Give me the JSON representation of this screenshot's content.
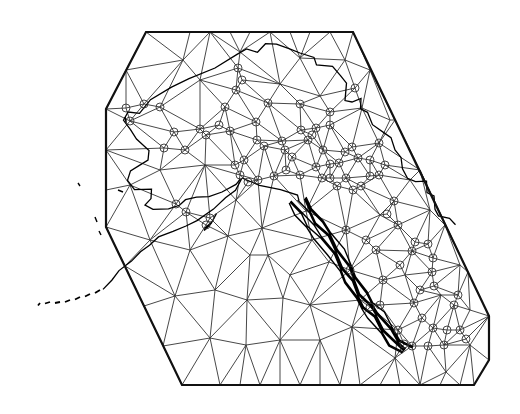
{
  "map": {
    "title": "Triangulated mesh over Alaska",
    "width": 520,
    "height": 414,
    "colors": {
      "background": "#ffffff",
      "hull": "#111111",
      "mesh": "#333333",
      "coast": "#000000",
      "station": "#333333"
    },
    "hull": [
      [
        146,
        32
      ],
      [
        353,
        32
      ],
      [
        489,
        316
      ],
      [
        489,
        360
      ],
      [
        474,
        385
      ],
      [
        182,
        385
      ],
      [
        106,
        227
      ],
      [
        106,
        109
      ]
    ],
    "stations": [
      [
        238,
        68
      ],
      [
        242,
        80
      ],
      [
        236,
        90
      ],
      [
        225,
        107
      ],
      [
        268,
        103
      ],
      [
        300,
        104
      ],
      [
        355,
        88
      ],
      [
        330,
        125
      ],
      [
        301,
        130
      ],
      [
        219,
        125
      ],
      [
        200,
        129
      ],
      [
        174,
        132
      ],
      [
        160,
        107
      ],
      [
        144,
        104
      ],
      [
        126,
        108
      ],
      [
        130,
        121
      ],
      [
        164,
        148
      ],
      [
        185,
        150
      ],
      [
        206,
        135
      ],
      [
        230,
        131
      ],
      [
        256,
        122
      ],
      [
        257,
        140
      ],
      [
        264,
        146
      ],
      [
        282,
        141
      ],
      [
        285,
        150
      ],
      [
        292,
        157
      ],
      [
        308,
        140
      ],
      [
        312,
        135
      ],
      [
        316,
        128
      ],
      [
        323,
        150
      ],
      [
        330,
        164
      ],
      [
        339,
        163
      ],
      [
        345,
        152
      ],
      [
        352,
        147
      ],
      [
        358,
        158
      ],
      [
        370,
        160
      ],
      [
        379,
        143
      ],
      [
        330,
        112
      ],
      [
        244,
        160
      ],
      [
        235,
        165
      ],
      [
        240,
        175
      ],
      [
        248,
        182
      ],
      [
        258,
        180
      ],
      [
        274,
        176
      ],
      [
        286,
        170
      ],
      [
        300,
        175
      ],
      [
        316,
        167
      ],
      [
        322,
        178
      ],
      [
        330,
        178
      ],
      [
        337,
        186
      ],
      [
        346,
        178
      ],
      [
        353,
        190
      ],
      [
        361,
        186
      ],
      [
        370,
        176
      ],
      [
        379,
        175
      ],
      [
        385,
        165
      ],
      [
        176,
        204
      ],
      [
        186,
        212
      ],
      [
        210,
        218
      ],
      [
        206,
        225
      ],
      [
        394,
        201
      ],
      [
        387,
        214
      ],
      [
        398,
        225
      ],
      [
        415,
        242
      ],
      [
        412,
        251
      ],
      [
        428,
        244
      ],
      [
        433,
        258
      ],
      [
        432,
        272
      ],
      [
        434,
        286
      ],
      [
        420,
        290
      ],
      [
        414,
        303
      ],
      [
        422,
        318
      ],
      [
        433,
        328
      ],
      [
        447,
        330
      ],
      [
        460,
        330
      ],
      [
        466,
        339
      ],
      [
        444,
        345
      ],
      [
        428,
        346
      ],
      [
        412,
        346
      ],
      [
        404,
        344
      ],
      [
        398,
        330
      ],
      [
        380,
        305
      ],
      [
        370,
        307
      ],
      [
        383,
        280
      ],
      [
        400,
        265
      ],
      [
        376,
        250
      ],
      [
        366,
        240
      ],
      [
        350,
        270
      ],
      [
        346,
        230
      ],
      [
        454,
        305
      ],
      [
        458,
        295
      ]
    ],
    "mesh_points": [
      [
        146,
        32
      ],
      [
        353,
        32
      ],
      [
        489,
        316
      ],
      [
        489,
        360
      ],
      [
        474,
        385
      ],
      [
        182,
        385
      ],
      [
        106,
        227
      ],
      [
        106,
        109
      ],
      [
        190,
        32
      ],
      [
        210,
        32
      ],
      [
        230,
        32
      ],
      [
        250,
        32
      ],
      [
        270,
        32
      ],
      [
        290,
        32
      ],
      [
        310,
        32
      ],
      [
        330,
        32
      ],
      [
        370,
        70
      ],
      [
        395,
        120
      ],
      [
        420,
        170
      ],
      [
        445,
        225
      ],
      [
        468,
        272
      ],
      [
        126,
        70
      ],
      [
        106,
        150
      ],
      [
        106,
        190
      ],
      [
        125,
        266
      ],
      [
        144,
        306
      ],
      [
        163,
        346
      ],
      [
        220,
        385
      ],
      [
        240,
        385
      ],
      [
        260,
        385
      ],
      [
        280,
        385
      ],
      [
        300,
        385
      ],
      [
        320,
        385
      ],
      [
        340,
        385
      ],
      [
        360,
        385
      ],
      [
        380,
        385
      ],
      [
        400,
        385
      ],
      [
        420,
        385
      ],
      [
        440,
        385
      ],
      [
        460,
        385
      ],
      [
        183,
        60
      ],
      [
        240,
        52
      ],
      [
        300,
        58
      ],
      [
        345,
        60
      ],
      [
        200,
        80
      ],
      [
        280,
        84
      ],
      [
        320,
        96
      ],
      [
        362,
        108
      ],
      [
        160,
        170
      ],
      [
        205,
        165
      ],
      [
        130,
        185
      ],
      [
        150,
        240
      ],
      [
        190,
        250
      ],
      [
        228,
        236
      ],
      [
        175,
        296
      ],
      [
        215,
        290
      ],
      [
        247,
        300
      ],
      [
        283,
        298
      ],
      [
        268,
        255
      ],
      [
        312,
        240
      ],
      [
        306,
        211
      ],
      [
        236,
        200
      ],
      [
        390,
        120
      ],
      [
        410,
        180
      ],
      [
        380,
        215
      ],
      [
        430,
        210
      ],
      [
        460,
        265
      ],
      [
        470,
        310
      ],
      [
        441,
        295
      ],
      [
        405,
        275
      ],
      [
        320,
        340
      ],
      [
        352,
        327
      ],
      [
        310,
        305
      ],
      [
        280,
        340
      ],
      [
        246,
        345
      ],
      [
        210,
        338
      ],
      [
        395,
        358
      ],
      [
        446,
        372
      ],
      [
        470,
        345
      ],
      [
        360,
        300
      ],
      [
        290,
        275
      ],
      [
        329,
        262
      ],
      [
        262,
        228
      ],
      [
        250,
        255
      ]
    ],
    "coastline": {
      "mainland": [
        [
          128,
          112
        ],
        [
          140,
          113
        ],
        [
          150,
          100
        ],
        [
          170,
          88
        ],
        [
          190,
          78
        ],
        [
          215,
          68
        ],
        [
          236,
          55
        ],
        [
          248,
          48
        ],
        [
          258,
          52
        ],
        [
          265,
          44
        ],
        [
          275,
          45
        ],
        [
          290,
          48
        ],
        [
          300,
          53
        ],
        [
          313,
          58
        ],
        [
          318,
          64
        ],
        [
          333,
          66
        ],
        [
          340,
          76
        ],
        [
          345,
          84
        ],
        [
          346,
          100
        ],
        [
          352,
          102
        ],
        [
          360,
          99
        ],
        [
          362,
          108
        ],
        [
          368,
          112
        ],
        [
          372,
          125
        ],
        [
          383,
          134
        ],
        [
          392,
          137
        ],
        [
          395,
          150
        ],
        [
          400,
          158
        ],
        [
          404,
          168
        ],
        [
          408,
          178
        ],
        [
          415,
          182
        ],
        [
          425,
          182
        ],
        [
          428,
          192
        ],
        [
          434,
          196
        ],
        [
          434,
          210
        ],
        [
          440,
          215
        ],
        [
          450,
          218
        ],
        [
          455,
          225
        ]
      ],
      "west_coast": [
        [
          128,
          112
        ],
        [
          124,
          120
        ],
        [
          130,
          130
        ],
        [
          135,
          140
        ],
        [
          150,
          150
        ],
        [
          148,
          160
        ],
        [
          140,
          165
        ],
        [
          132,
          170
        ],
        [
          128,
          180
        ],
        [
          134,
          190
        ],
        [
          150,
          190
        ],
        [
          152,
          198
        ],
        [
          145,
          205
        ],
        [
          152,
          210
        ],
        [
          170,
          208
        ],
        [
          180,
          205
        ],
        [
          185,
          200
        ],
        [
          195,
          198
        ],
        [
          210,
          196
        ],
        [
          222,
          192
        ],
        [
          235,
          185
        ],
        [
          242,
          178
        ]
      ],
      "peninsula": [
        [
          242,
          178
        ],
        [
          236,
          190
        ],
        [
          225,
          198
        ],
        [
          212,
          210
        ],
        [
          198,
          220
        ],
        [
          186,
          226
        ],
        [
          172,
          232
        ],
        [
          160,
          236
        ],
        [
          150,
          245
        ],
        [
          140,
          252
        ],
        [
          130,
          262
        ],
        [
          120,
          270
        ],
        [
          112,
          280
        ],
        [
          102,
          290
        ]
      ],
      "aleutians": [
        [
          100,
          290
        ],
        [
          90,
          294
        ],
        [
          80,
          297
        ],
        [
          70,
          300
        ],
        [
          60,
          302
        ],
        [
          50,
          302
        ],
        [
          40,
          303
        ],
        [
          36,
          306
        ]
      ],
      "islands": [
        [
          78,
          183
        ],
        [
          80,
          186
        ],
        [
          95,
          217
        ],
        [
          97,
          222
        ],
        [
          99,
          231
        ],
        [
          101,
          235
        ],
        [
          125,
          117
        ],
        [
          126,
          122
        ],
        [
          118,
          190
        ],
        [
          123,
          192
        ]
      ],
      "panhandle": [
        [
          300,
          200
        ],
        [
          308,
          212
        ],
        [
          316,
          224
        ],
        [
          326,
          236
        ],
        [
          336,
          252
        ],
        [
          345,
          268
        ],
        [
          352,
          280
        ],
        [
          360,
          295
        ],
        [
          368,
          306
        ],
        [
          376,
          315
        ],
        [
          386,
          330
        ],
        [
          396,
          343
        ],
        [
          406,
          350
        ]
      ],
      "south_coast": [
        [
          242,
          178
        ],
        [
          260,
          185
        ],
        [
          280,
          190
        ],
        [
          296,
          196
        ],
        [
          300,
          200
        ]
      ],
      "kodiak": [
        [
          205,
          228
        ],
        [
          212,
          222
        ],
        [
          216,
          214
        ],
        [
          210,
          224
        ],
        [
          205,
          230
        ]
      ]
    }
  }
}
